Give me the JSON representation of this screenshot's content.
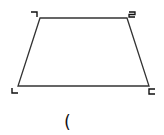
{
  "diagram": {
    "shape": "trapezoid",
    "stroke_color": "#333333",
    "vertices": [
      {
        "label": "¬",
        "x": 40,
        "y": 18,
        "label_x": 31,
        "label_y": 17
      },
      {
        "label": "2",
        "x": 127,
        "y": 18,
        "label_x": 128,
        "label_y": 17
      },
      {
        "label": "c",
        "x": 149,
        "y": 86,
        "label_x": 148,
        "label_y": 93
      },
      {
        "label": "L",
        "x": 18,
        "y": 86,
        "label_x": 11,
        "label_y": 94
      }
    ],
    "caption": "("
  }
}
